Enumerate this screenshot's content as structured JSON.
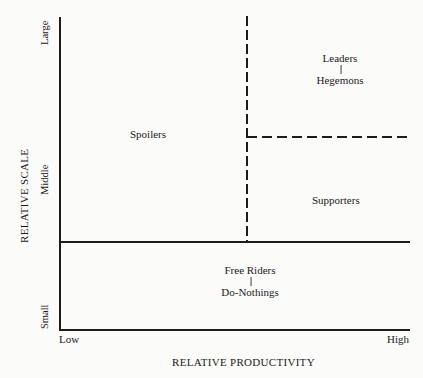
{
  "diagram": {
    "y_axis": {
      "title": "RELATIVE SCALE",
      "ticks": [
        "Small",
        "Middle",
        "Large"
      ]
    },
    "x_axis": {
      "title": "RELATIVE PRODUCTIVITY",
      "ticks": [
        "Low",
        "High"
      ]
    },
    "regions": {
      "spoilers": "Spoilers",
      "leaders": {
        "top": "Leaders",
        "separator": "||",
        "bottom": "Hegemons"
      },
      "supporters": "Supporters",
      "free_riders": {
        "top": "Free Riders",
        "separator": "||",
        "bottom": "Do-Nothings"
      }
    }
  }
}
